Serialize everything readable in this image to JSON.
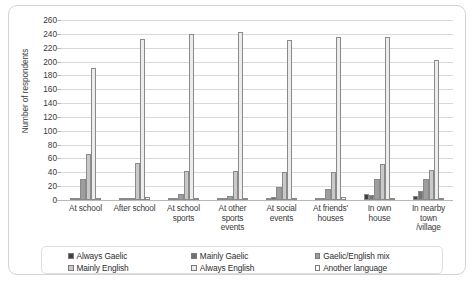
{
  "chart_data": {
    "type": "bar",
    "title": "",
    "subtitle": "",
    "xlabel": "",
    "ylabel": "Number of respondents",
    "ylim": [
      0,
      260
    ],
    "yticks": [
      0,
      20,
      40,
      60,
      80,
      100,
      120,
      140,
      160,
      180,
      200,
      220,
      240,
      260
    ],
    "grid": true,
    "legend_position": "bottom",
    "categories": [
      "At school",
      "After school",
      "At school sports",
      "At other sports events",
      "At social events",
      "At friends' houses",
      "In own house",
      "In nearby town /village"
    ],
    "category_lines": [
      [
        "At school"
      ],
      [
        "After school"
      ],
      [
        "At school",
        "sports"
      ],
      [
        "At other",
        "sports",
        "events"
      ],
      [
        "At social",
        "events"
      ],
      [
        "At friends'",
        "houses"
      ],
      [
        "In own",
        "house"
      ],
      [
        "In nearby",
        "town",
        "/village"
      ]
    ],
    "series": [
      {
        "name": "Always Gaelic",
        "color": "#404040",
        "values": [
          3,
          1,
          2,
          1,
          2,
          3,
          8,
          6
        ]
      },
      {
        "name": "Mainly Gaelic",
        "color": "#737373",
        "values": [
          3,
          2,
          3,
          2,
          4,
          3,
          7,
          13
        ]
      },
      {
        "name": "Gaelic/English mix",
        "color": "#9e9e9e",
        "values": [
          31,
          3,
          9,
          6,
          19,
          16,
          30,
          30
        ]
      },
      {
        "name": "Mainly English",
        "color": "#c9c9c9",
        "values": [
          66,
          53,
          42,
          42,
          40,
          40,
          52,
          44
        ]
      },
      {
        "name": "Always English",
        "color": "#ececec",
        "values": [
          191,
          233,
          240,
          243,
          231,
          236,
          236,
          202
        ]
      },
      {
        "name": "Another language",
        "color": "#ffffff",
        "values": [
          1,
          4,
          1,
          2,
          2,
          4,
          3,
          2
        ]
      }
    ]
  }
}
